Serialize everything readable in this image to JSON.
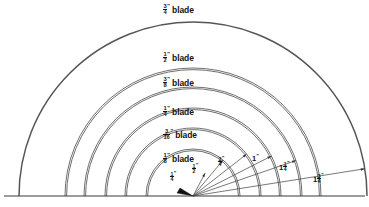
{
  "figure": {
    "background_color": "#ffffff",
    "line_color": "#4a4a4a",
    "text_color": "#141414",
    "width": 369,
    "height": 207
  },
  "geometry": {
    "center_x": 193,
    "center_y": 196,
    "baseline_y": 196
  },
  "chart_data": {
    "type": "diagram",
    "center": [
      193,
      196
    ],
    "blade_arcs": [
      {
        "label_whole": "",
        "label_num": "3",
        "label_den": "4",
        "inch": "”",
        "word": "blade",
        "radius_px": 174,
        "label_x": 163,
        "label_y": 4
      },
      {
        "label_whole": "",
        "label_num": "1",
        "label_den": "2",
        "inch": "”",
        "word": "blade",
        "radius_px": 128,
        "label_x": 163,
        "label_y": 52
      },
      {
        "label_whole": "",
        "label_num": "3",
        "label_den": "8",
        "inch": "”",
        "word": "blade",
        "radius_px": 109,
        "label_x": 163,
        "label_y": 77
      },
      {
        "label_whole": "",
        "label_num": "1",
        "label_den": "4",
        "inch": "”",
        "word": "blade",
        "radius_px": 88,
        "label_x": 163,
        "label_y": 106
      },
      {
        "label_whole": "",
        "label_num": "3",
        "label_den": "16",
        "inch": "”",
        "word": "blade",
        "radius_px": 68,
        "label_x": 163,
        "label_y": 129
      },
      {
        "label_whole": "",
        "label_num": "1",
        "label_den": "8",
        "inch": "”",
        "word": "blade",
        "radius_px": 47,
        "label_x": 163,
        "label_y": 153
      }
    ],
    "radius_callouts": [
      {
        "label_whole": "",
        "label_num": "1",
        "label_den": "4",
        "inch": "”",
        "radius_px": 26,
        "angle_deg": 62,
        "label_x": 170,
        "label_y": 172
      },
      {
        "label_whole": "",
        "label_num": "1",
        "label_den": "2",
        "inch": "”",
        "radius_px": 47,
        "angle_deg": 50,
        "label_x": 192,
        "label_y": 164
      },
      {
        "label_whole": "",
        "label_num": "3",
        "label_den": "4",
        "inch": "”",
        "radius_px": 68,
        "angle_deg": 38,
        "label_x": 218,
        "label_y": 157
      },
      {
        "label_whole": "1",
        "label_num": "",
        "label_den": "",
        "inch": "”",
        "radius_px": 88,
        "angle_deg": 27,
        "label_x": 252,
        "label_y": 155
      },
      {
        "label_whole": "1",
        "label_num": "1",
        "label_den": "4",
        "inch": "”",
        "radius_px": 109,
        "angle_deg": 19,
        "label_x": 279,
        "label_y": 162
      },
      {
        "label_whole": "1",
        "label_num": "3",
        "label_den": "4",
        "inch": "”",
        "radius_px": 174,
        "angle_deg": 9,
        "label_x": 313,
        "label_y": 174
      }
    ]
  }
}
